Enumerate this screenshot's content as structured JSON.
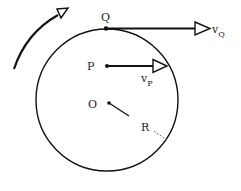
{
  "diagram": {
    "type": "rotating-disk-velocity",
    "circle": {
      "cx": 107,
      "cy": 100,
      "r": 71
    },
    "points": {
      "Q": {
        "label": "Q",
        "x": 106,
        "y": 29
      },
      "P": {
        "label": "P",
        "x": 107,
        "y": 66
      },
      "O": {
        "label": "O",
        "x": 109,
        "y": 103
      }
    },
    "vectors": {
      "vQ": {
        "label": "v",
        "subscript": "Q",
        "from": [
          106,
          29
        ],
        "to": [
          210,
          29
        ]
      },
      "vP": {
        "label": "v",
        "subscript": "P",
        "from": [
          107,
          66
        ],
        "to": [
          167,
          66
        ]
      }
    },
    "radius_label": "R",
    "rotation_direction": "clockwise"
  }
}
